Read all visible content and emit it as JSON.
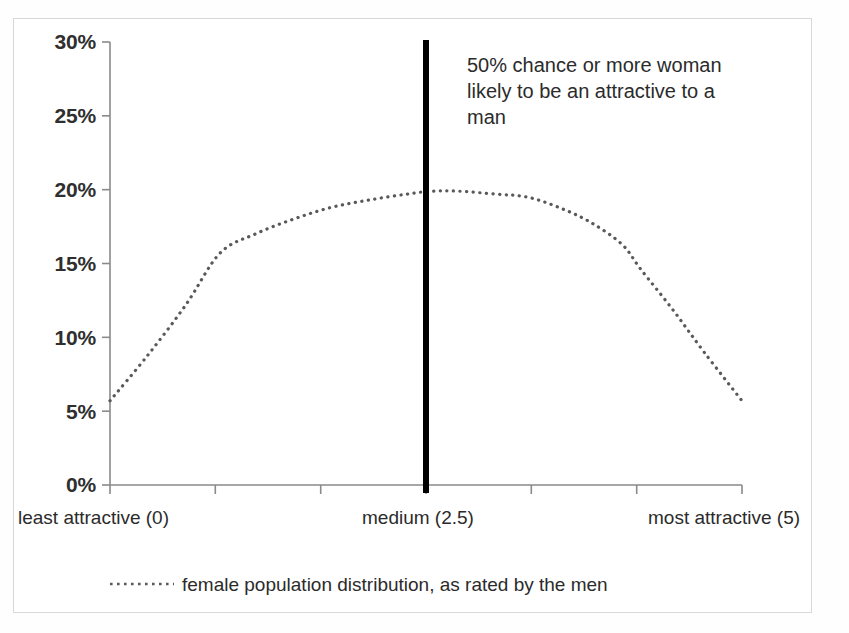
{
  "chart_data": {
    "type": "line",
    "title": "",
    "subtitle": "",
    "xlabel": "",
    "ylabel": "",
    "xlim": [
      0,
      5
    ],
    "ylim": [
      0,
      0.3
    ],
    "grid": false,
    "legend_position": "bottom",
    "y_tick_labels": [
      "30%",
      "25%",
      "20%",
      "15%",
      "10%",
      "5%",
      "0%"
    ],
    "y_tick_values": [
      0.3,
      0.25,
      0.2,
      0.15,
      0.1,
      0.05,
      0.0
    ],
    "x_tick_values": [
      0,
      0.833,
      1.667,
      2.5,
      3.333,
      4.167,
      5
    ],
    "x_category_labels": [
      "least attractive (0)",
      "medium (2.5)",
      "most attractive (5)"
    ],
    "series": [
      {
        "name": "female population distribution, as rated by the men",
        "style": "dotted",
        "color": "#595959",
        "x": [
          0.0,
          0.3,
          0.6,
          0.87,
          1.15,
          1.45,
          1.75,
          2.05,
          2.35,
          2.55,
          2.75,
          3.05,
          3.3,
          3.55,
          3.8,
          4.05,
          4.2,
          4.45,
          4.7,
          5.0
        ],
        "values": [
          0.057,
          0.088,
          0.122,
          0.157,
          0.17,
          0.18,
          0.188,
          0.193,
          0.197,
          0.199,
          0.199,
          0.197,
          0.195,
          0.188,
          0.178,
          0.163,
          0.146,
          0.119,
          0.09,
          0.057
        ]
      }
    ],
    "annotations": [
      {
        "name": "median-threshold-line",
        "type": "vline",
        "x": 2.5,
        "color": "#000000",
        "width_px": 6
      },
      {
        "name": "threshold-callout",
        "type": "text",
        "lines": [
          "50% chance or more woman",
          "likely to be an attractive to a",
          "man"
        ]
      }
    ]
  },
  "legend": {
    "entries": [
      {
        "label": "female population distribution, as rated by the men",
        "marker": "dotted-line-marker"
      }
    ]
  },
  "colors": {
    "series_line": "#595959",
    "threshold_line": "#000000",
    "axis": "#808080",
    "text": "#2b2b2b",
    "frame": "#d8d8d8",
    "background": "#ffffff"
  }
}
